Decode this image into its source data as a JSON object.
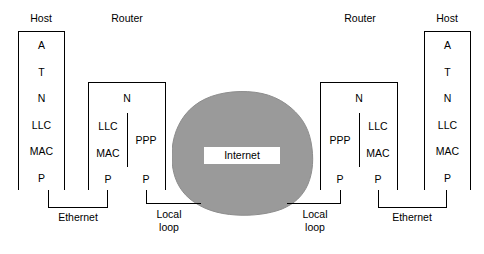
{
  "diagram": {
    "cloud_color": "#9a9a9a",
    "line_color": "#000000"
  },
  "columns": {
    "left_host_title": "Host",
    "left_router_title": "Router",
    "right_router_title": "Router",
    "right_host_title": "Host"
  },
  "left_host": {
    "layers": [
      "A",
      "T",
      "N",
      "LLC",
      "MAC",
      "P"
    ]
  },
  "right_host": {
    "layers": [
      "A",
      "T",
      "N",
      "LLC",
      "MAC",
      "P"
    ]
  },
  "left_router": {
    "network_layer": "N",
    "lan_side": [
      "LLC",
      "MAC"
    ],
    "wan_side": "PPP",
    "physical_lan": "P",
    "physical_wan": "P"
  },
  "right_router": {
    "network_layer": "N",
    "wan_side": "PPP",
    "lan_side": [
      "LLC",
      "MAC"
    ],
    "physical_wan": "P",
    "physical_lan": "P"
  },
  "cloud": {
    "label": "Internet"
  },
  "links": {
    "left_ethernet": "Ethernet",
    "left_local_loop_line1": "Local",
    "left_local_loop_line2": "loop",
    "right_local_loop_line1": "Local",
    "right_local_loop_line2": "loop",
    "right_ethernet": "Ethernet"
  }
}
